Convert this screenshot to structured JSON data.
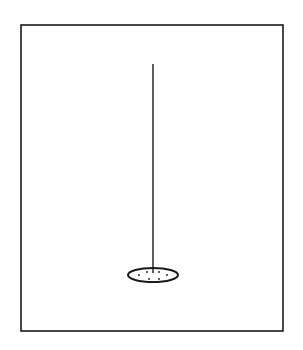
{
  "diagram": {
    "colors": {
      "background": "#ffffff",
      "stroke": "#1a1a1a"
    },
    "frame": {
      "x": 21,
      "y": 25,
      "width": 262,
      "height": 306
    },
    "vertical_line": {
      "x": 153,
      "y1": 64,
      "y2": 273
    },
    "ellipse": {
      "cx": 153,
      "cy": 275,
      "rx": 25,
      "ry": 7
    },
    "dots": [
      {
        "cx": 139,
        "cy": 275
      },
      {
        "cx": 147,
        "cy": 272
      },
      {
        "cx": 149,
        "cy": 279
      },
      {
        "cx": 159,
        "cy": 272
      },
      {
        "cx": 159,
        "cy": 279
      },
      {
        "cx": 167,
        "cy": 275
      }
    ]
  }
}
